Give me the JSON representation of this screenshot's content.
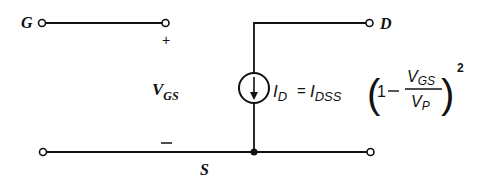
{
  "diagram": {
    "type": "circuit",
    "terminals": {
      "gate": "G",
      "drain": "D",
      "source": "S"
    },
    "polarity": {
      "plus": "+",
      "minus": "–"
    },
    "voltage_label": {
      "main": "V",
      "sub": "GS"
    },
    "equation": {
      "lhs_main": "I",
      "lhs_sub": "D",
      "equals": "=",
      "coef_main": "I",
      "coef_sub": "DSS",
      "open_paren": "(",
      "one": "1",
      "minus": "–",
      "num_main": "V",
      "num_sub": "GS",
      "den_main": "V",
      "den_sub": "P",
      "close_paren": ")",
      "exponent": "2"
    },
    "colors": {
      "ink": "#111111",
      "background": "#ffffff"
    }
  }
}
